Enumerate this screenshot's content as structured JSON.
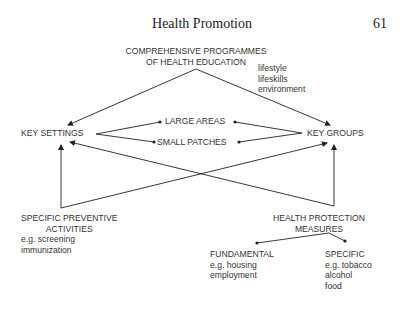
{
  "header": {
    "title": "Health Promotion",
    "page_number": "61"
  },
  "diagram": {
    "top_node": {
      "line1": "COMPREHENSIVE PROGRAMMES",
      "line2": "OF HEALTH EDUCATION",
      "notes": [
        "lifestyle",
        "lifeskills",
        "environment"
      ]
    },
    "key_settings": "KEY SETTINGS",
    "key_groups": "KEY GROUPS",
    "large_areas": "LARGE AREAS",
    "small_patches": "SMALL PATCHES",
    "preventive": {
      "line1": "SPECIFIC PREVENTIVE",
      "line2": "ACTIVITIES",
      "examples": [
        "e.g. screening",
        "immunization"
      ]
    },
    "protection": {
      "line1": "HEALTH PROTECTION",
      "line2": "MEASURES"
    },
    "fundamental": {
      "title": "FUNDAMENTAL",
      "examples": [
        "e.g. housing",
        "employment"
      ]
    },
    "specific": {
      "title": "SPECIFIC",
      "examples": [
        "e.g. tobacco",
        "alcohol",
        "food"
      ]
    }
  }
}
